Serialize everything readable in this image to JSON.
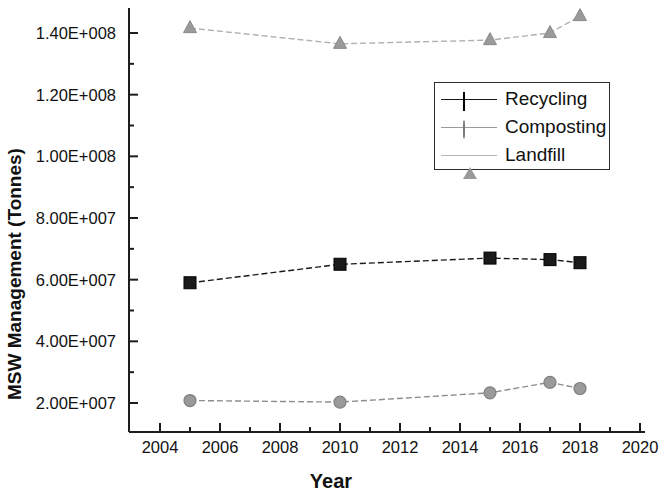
{
  "chart_data": {
    "type": "line",
    "title": "",
    "xlabel": "Year",
    "ylabel": "MSW Management (Tonnes)",
    "xlim": [
      2004,
      2020
    ],
    "ylim": [
      14000000,
      148000000
    ],
    "grid": false,
    "legend_position": "upper right",
    "x": [
      2005,
      2010,
      2015,
      2017,
      2018
    ],
    "xticks": [
      2004,
      2006,
      2008,
      2010,
      2012,
      2014,
      2016,
      2018,
      2020
    ],
    "xtick_labels": [
      "2004",
      "2006",
      "2008",
      "2010",
      "2012",
      "2014",
      "2016",
      "2018",
      "2020"
    ],
    "yticks": [
      20000000,
      40000000,
      60000000,
      80000000,
      100000000,
      120000000,
      140000000
    ],
    "ytick_labels": [
      "2.00E+007",
      "4.00E+007",
      "6.00E+007",
      "8.00E+007",
      "1.00E+008",
      "1.20E+008",
      "1.40E+008"
    ],
    "series": [
      {
        "name": "Recycling",
        "marker": "square",
        "color": "#1a1a1a",
        "values": [
          59000000,
          65000000,
          67000000,
          66500000,
          65500000
        ]
      },
      {
        "name": "Composting",
        "marker": "circle",
        "color": "#9a9a9a",
        "values": [
          20800000,
          20300000,
          23300000,
          26700000,
          24700000
        ]
      },
      {
        "name": "Landfill",
        "marker": "triangle",
        "color": "#9a9a9a",
        "values": [
          141600000,
          136500000,
          137700000,
          140000000,
          145500000
        ]
      }
    ]
  },
  "legend": {
    "entries": [
      {
        "label": "Recycling"
      },
      {
        "label": "Composting"
      },
      {
        "label": "Landfill"
      }
    ]
  },
  "axes": {
    "x_title": "Year",
    "y_title": "MSW Management (Tonnes)"
  }
}
